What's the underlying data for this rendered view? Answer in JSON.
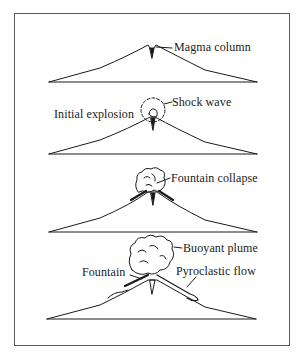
{
  "diagram": {
    "panels": [
      {
        "stage": 1,
        "labels": [
          {
            "text": "Magma column"
          }
        ]
      },
      {
        "stage": 2,
        "labels": [
          {
            "text": "Shock wave"
          },
          {
            "text": "Initial explosion"
          }
        ]
      },
      {
        "stage": 3,
        "labels": [
          {
            "text": "Fountain collapse"
          }
        ]
      },
      {
        "stage": 4,
        "labels": [
          {
            "text": "Buoyant plume"
          },
          {
            "text": "Fountain"
          },
          {
            "text": "Pyroclastic flow"
          }
        ]
      }
    ],
    "colors": {
      "line": "#1a1a1a",
      "frame": "#5a5a5a",
      "background": "#ffffff"
    }
  }
}
